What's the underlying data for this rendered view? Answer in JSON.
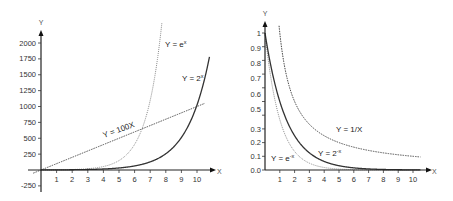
{
  "chart_data": [
    {
      "type": "line",
      "title": "",
      "xlabel": "X",
      "ylabel": "Y",
      "xlim": [
        -0.5,
        10.8
      ],
      "ylim": [
        -300,
        2250
      ],
      "x_ticks": [
        1,
        2,
        3,
        4,
        5,
        6,
        7,
        8,
        9,
        10
      ],
      "x_tick_labels": [
        "1",
        "2",
        "3",
        "4",
        "5",
        "6",
        "7",
        "8",
        "9",
        "10"
      ],
      "y_ticks": [
        -250,
        250,
        500,
        750,
        1000,
        1250,
        1500,
        1750,
        2000
      ],
      "y_tick_labels": [
        "-250",
        "250",
        "500",
        "750",
        "1000",
        "1250",
        "1500",
        "1750",
        "2000"
      ],
      "grid": false,
      "series": [
        {
          "name": "Y = e^x",
          "label": "Y = e",
          "label_sup": "x",
          "style": "dotted-light",
          "function": "exp",
          "x_range": [
            0,
            7.75
          ]
        },
        {
          "name": "Y = 2^x",
          "label": "Y = 2",
          "label_sup": "x",
          "style": "solid",
          "function": "pow2",
          "x_range": [
            0,
            10.8
          ]
        },
        {
          "name": "Y = 100X",
          "label": "Y = 100X",
          "style": "dashed",
          "function": "linear100",
          "x_range": [
            -0.5,
            10.5
          ]
        }
      ]
    },
    {
      "type": "line",
      "title": "",
      "xlabel": "X",
      "ylabel": "Y",
      "xlim": [
        0,
        10.8
      ],
      "ylim": [
        0,
        1.05
      ],
      "x_ticks": [
        1,
        2,
        3,
        4,
        5,
        6,
        7,
        8,
        9,
        10
      ],
      "x_tick_labels": [
        "1",
        "2",
        "3",
        "4",
        "5",
        "6",
        "7",
        "8",
        "9",
        "10"
      ],
      "y_ticks": [
        0,
        0.1,
        0.2,
        0.3,
        0.4,
        0.5,
        0.6,
        0.7,
        0.8,
        0.9,
        1
      ],
      "y_tick_labels": [
        "0.0",
        "0.1",
        "0.2",
        "0.3",
        "0.5",
        "0.6",
        "0.7",
        "0.8",
        "0.9",
        "1"
      ],
      "y_tick_label_positions": [
        0,
        0.1,
        0.2,
        0.3,
        0.4,
        0.5,
        0.6,
        0.7,
        0.8,
        0.9,
        1
      ],
      "grid": false,
      "series": [
        {
          "name": "Y = e^-x",
          "label": "Y = e",
          "label_sup": "-x",
          "style": "dotted-light",
          "function": "expneg",
          "x_range": [
            0,
            10.5
          ]
        },
        {
          "name": "Y = 2^-x",
          "label": "Y = 2",
          "label_sup": "-x",
          "style": "solid",
          "function": "pow2neg",
          "x_range": [
            0,
            10.5
          ]
        },
        {
          "name": "Y = 1/X",
          "label": "Y = 1/X",
          "style": "dashed",
          "function": "inverse",
          "x_range": [
            0.95,
            10.5
          ]
        }
      ]
    }
  ]
}
